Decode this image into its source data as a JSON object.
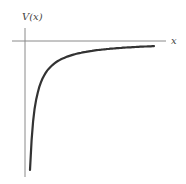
{
  "chart_data": {
    "type": "line",
    "title": "",
    "xlabel": "x",
    "ylabel": "V(x)",
    "grid": false,
    "legend": null,
    "series": [
      {
        "name": "V(x) ~ -1/x",
        "description": "Attractive potential approaching zero from below as x increases, diverging to negative infinity as x approaches 0",
        "x": [
          0.1,
          0.15,
          0.2,
          0.3,
          0.5,
          0.75,
          1.0,
          1.5,
          2.0,
          3.0
        ],
        "y": [
          -10,
          -6.67,
          -5,
          -3.33,
          -2,
          -1.33,
          -1,
          -0.67,
          -0.5,
          -0.33
        ]
      }
    ],
    "ticks": {
      "x": [],
      "y": []
    }
  },
  "labels": {
    "y_axis": "V(x)",
    "x_axis": "x"
  },
  "colors": {
    "curve": "#333333",
    "axes": "#888888"
  }
}
